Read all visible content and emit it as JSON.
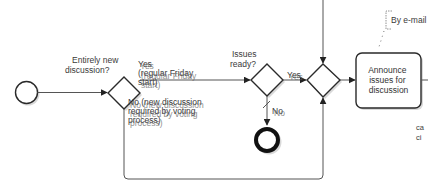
{
  "diagram": {
    "type": "bpmn-process-fragment",
    "nodes": {
      "start_event": {
        "kind": "start-event"
      },
      "gateway_new_discussion": {
        "kind": "exclusive-gateway",
        "label": "Entirely new discussion?",
        "label_lines": [
          "Entirely new",
          "discussion?"
        ]
      },
      "gateway_issues_ready": {
        "kind": "exclusive-gateway",
        "label": "Issues ready?",
        "label_lines": [
          "Issues",
          "ready?"
        ]
      },
      "gateway_merge": {
        "kind": "exclusive-gateway"
      },
      "end_event": {
        "kind": "end-event"
      },
      "task_announce": {
        "kind": "task",
        "label": "Announce issues for discussion",
        "label_lines": [
          "Announce",
          "issues for",
          "discussion"
        ]
      },
      "annotation_email": {
        "kind": "text-annotation",
        "label": "By e-mail"
      }
    },
    "edges": {
      "yes_regular": {
        "label": "Yes (regular Friday start)",
        "label_lines": [
          "Yes",
          "(regular Friday",
          "start)"
        ]
      },
      "no_new_discussion": {
        "label": "No (new discussion required by voting process)",
        "label_lines": [
          "No (new discussion",
          "required by voting",
          "process)"
        ]
      },
      "issues_yes": {
        "label": "Yes"
      },
      "issues_no": {
        "label": "No"
      }
    },
    "clipped_text": [
      "ca",
      "ci"
    ]
  }
}
